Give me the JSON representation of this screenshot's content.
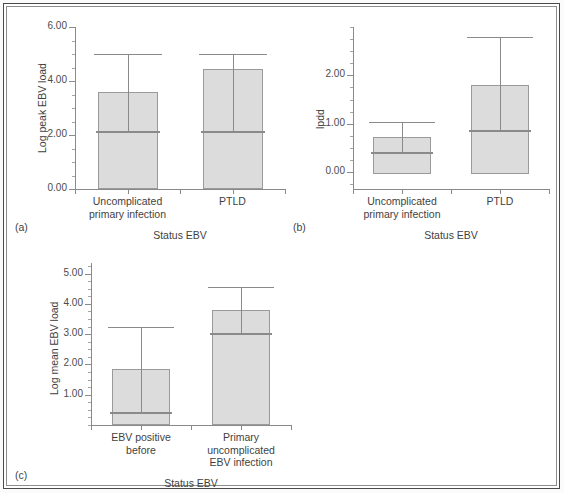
{
  "figure": {
    "panel_tags": [
      "(a)",
      "(b)",
      "(c)"
    ],
    "xlabel_common": "Status EBV"
  },
  "chart_data": [
    {
      "type": "bar",
      "panel": "(a)",
      "title": "",
      "xlabel": "Status EBV",
      "ylabel": "Log peak EBV load",
      "categories": [
        "Uncomplicated primary infection",
        "PTLD"
      ],
      "category_lines": [
        [
          "Uncomplicated",
          "primary infection"
        ],
        [
          "PTLD"
        ]
      ],
      "values": [
        3.58,
        4.45
      ],
      "error_upper": [
        5.0,
        5.0
      ],
      "error_lower": [
        2.15,
        2.15
      ],
      "baseline": 0.0,
      "ylim": [
        0.0,
        6.0
      ],
      "yticks": [
        0.0,
        2.0,
        4.0,
        6.0
      ],
      "ytick_labels": [
        "0.00",
        "2.00",
        "4.00",
        "6.00"
      ],
      "yminor_step": 0.5,
      "grid": false,
      "legend": "none"
    },
    {
      "type": "bar",
      "panel": "(b)",
      "title": "",
      "xlabel": "Status EBV",
      "ylabel": "lpdd",
      "categories": [
        "Uncomplicated primary infection",
        "PTLD"
      ],
      "category_lines": [
        [
          "Uncomplicated",
          "primary infection"
        ],
        [
          "PTLD"
        ]
      ],
      "values": [
        0.72,
        1.8
      ],
      "error_upper": [
        1.03,
        2.8
      ],
      "error_lower": [
        0.41,
        0.87
      ],
      "baseline": -0.05,
      "ylim": [
        -0.35,
        3.0
      ],
      "yticks": [
        0.0,
        1.0,
        2.0
      ],
      "ytick_labels": [
        "0.00",
        "1.00",
        "2.00"
      ],
      "yminor_step": 0.25,
      "grid": false,
      "legend": "none"
    },
    {
      "type": "bar",
      "panel": "(c)",
      "title": "",
      "xlabel": "Status EBV",
      "ylabel": "Log mean EBV load",
      "categories": [
        "EBV positive before",
        "Primary uncomplicated EBV infection"
      ],
      "category_lines": [
        [
          "EBV positive",
          "before"
        ],
        [
          "Primary",
          "uncomplicated",
          "EBV infection"
        ]
      ],
      "values": [
        1.85,
        3.8
      ],
      "error_upper": [
        3.22,
        4.55
      ],
      "error_lower": [
        0.42,
        3.05
      ],
      "baseline": 0.0,
      "ylim": [
        0.0,
        5.35
      ],
      "yticks": [
        1.0,
        2.0,
        3.0,
        4.0,
        5.0
      ],
      "ytick_labels": [
        "1.00",
        "2.00",
        "3.00",
        "4.00",
        "5.00"
      ],
      "yminor_step": 0.25,
      "grid": false,
      "legend": "none"
    }
  ],
  "colors": {
    "bar_fill": "#dcdcdc",
    "bar_border": "#9a9a9a",
    "axis": "#8a8a8a",
    "text": "#3f3f3f",
    "frame_outer": "#4a4a4a",
    "frame_inner": "#8d8d8d"
  }
}
